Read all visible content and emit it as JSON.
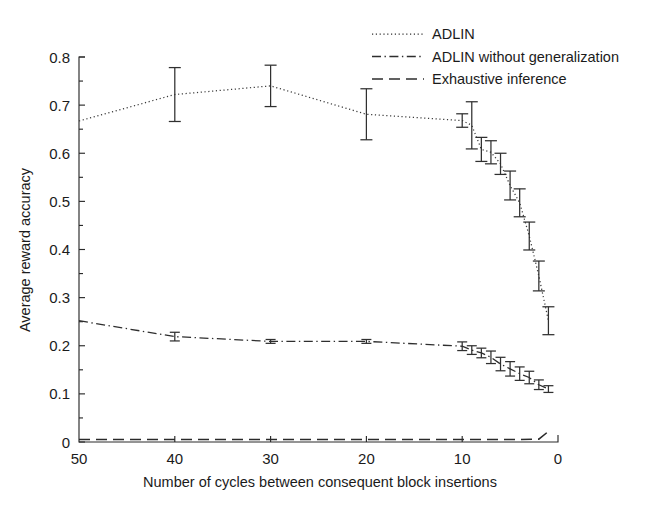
{
  "chart_data": {
    "type": "line",
    "title": "",
    "xlabel": "Number of cycles between consequent block insertions",
    "ylabel": "Average reward accuracy",
    "xlim": [
      50,
      0
    ],
    "ylim": [
      0,
      0.8
    ],
    "x_ticks": [
      50,
      40,
      30,
      20,
      10,
      0
    ],
    "x_tick_labels": [
      "50",
      "40",
      "30",
      "20",
      "10",
      "0"
    ],
    "y_ticks": [
      0,
      0.1,
      0.2,
      0.3,
      0.4,
      0.5,
      0.6,
      0.7,
      0.8
    ],
    "y_tick_labels": [
      "0",
      "0.1",
      "0.2",
      "0.3",
      "0.4",
      "0.5",
      "0.6",
      "0.7",
      "0.8"
    ],
    "x_axis_reversed": true,
    "grid": false,
    "legend_position": "top-right",
    "series": [
      {
        "name": "ADLIN",
        "style": "dotted",
        "x": [
          50,
          40,
          30,
          20,
          10,
          9,
          8,
          7,
          6,
          5,
          4,
          3,
          2,
          1
        ],
        "values": [
          0.667,
          0.722,
          0.74,
          0.681,
          0.668,
          0.658,
          0.608,
          0.602,
          0.578,
          0.533,
          0.497,
          0.428,
          0.345,
          0.252
        ],
        "errors": [
          0.0,
          0.056,
          0.043,
          0.053,
          0.014,
          0.049,
          0.025,
          0.024,
          0.022,
          0.03,
          0.029,
          0.029,
          0.031,
          0.029
        ]
      },
      {
        "name": "ADLIN without generalization",
        "style": "dash-dot",
        "x": [
          50,
          40,
          30,
          20,
          10,
          9,
          8,
          7,
          6,
          5,
          4,
          3,
          2,
          1
        ],
        "values": [
          0.252,
          0.219,
          0.209,
          0.209,
          0.199,
          0.191,
          0.185,
          0.176,
          0.162,
          0.152,
          0.142,
          0.134,
          0.119,
          0.11
        ],
        "errors": [
          0.0,
          0.009,
          0.004,
          0.004,
          0.009,
          0.009,
          0.01,
          0.013,
          0.014,
          0.015,
          0.014,
          0.013,
          0.01,
          0.007
        ]
      },
      {
        "name": "Exhaustive inference",
        "style": "dashed",
        "x": [
          50,
          40,
          30,
          20,
          10,
          5,
          2,
          1
        ],
        "values": [
          0.005,
          0.005,
          0.005,
          0.005,
          0.005,
          0.005,
          0.006,
          0.022
        ],
        "errors": [
          0.0,
          0.0,
          0.0,
          0.0,
          0.0,
          0.0,
          0.0,
          0.0
        ]
      }
    ]
  },
  "legend": {
    "items": [
      {
        "label": "ADLIN",
        "style": "dotted"
      },
      {
        "label": "ADLIN without generalization",
        "style": "dash-dot"
      },
      {
        "label": "Exhaustive inference",
        "style": "dashed"
      }
    ]
  },
  "colors": {
    "line": "#2e2e2e",
    "axis": "#2a2a2a",
    "text": "#1b1b1b",
    "background": "#ffffff"
  }
}
